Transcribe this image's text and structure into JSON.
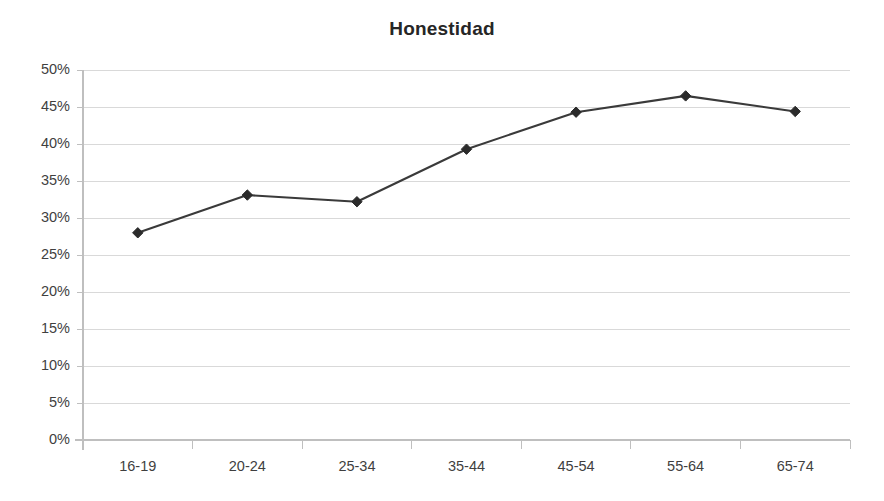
{
  "chart_data": {
    "type": "line",
    "title": "Honestidad",
    "xlabel": "",
    "ylabel": "",
    "categories": [
      "16-19",
      "20-24",
      "25-34",
      "35-44",
      "45-54",
      "55-64",
      "65-74"
    ],
    "values": [
      28.0,
      33.1,
      32.2,
      39.3,
      44.3,
      46.5,
      44.4
    ],
    "value_labels": [
      "28.0%",
      "33.1%",
      "32.2%",
      "39.3%",
      "44.3%",
      "46.5%",
      "44.4%"
    ],
    "ylim": [
      0,
      50
    ],
    "ytick_values": [
      0,
      5,
      10,
      15,
      20,
      25,
      30,
      35,
      40,
      45,
      50
    ],
    "ytick_labels": [
      "0%",
      "5%",
      "10%",
      "15%",
      "20%",
      "25%",
      "30%",
      "35%",
      "40%",
      "45%",
      "50%"
    ],
    "grid": true,
    "grid_axis": "y",
    "legend": false,
    "legend_position": "none",
    "series": [
      {
        "name": "Honestidad",
        "values": [
          28.0,
          33.1,
          32.2,
          39.3,
          44.3,
          46.5,
          44.4
        ],
        "marker": "diamond",
        "line_color": "#3a3a3a",
        "marker_color": "#2b2b2b"
      }
    ],
    "colors": {
      "line": "#3a3a3a",
      "marker": "#2b2b2b",
      "grid": "#d9d9d9",
      "axis": "#bfbfbf",
      "title": "#262626",
      "tick_label": "#3f3f3f",
      "background": "#ffffff"
    }
  }
}
